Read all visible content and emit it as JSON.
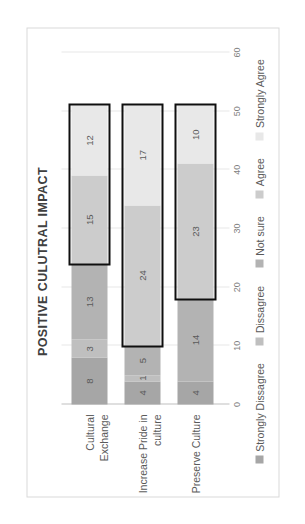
{
  "chart_data": {
    "type": "bar",
    "orientation": "horizontal-stacked",
    "title": "POSITIVE CULUTRAL IMPACT",
    "xlabel": "",
    "ylabel": "",
    "xlim": [
      0,
      60
    ],
    "xticks": [
      0,
      10,
      20,
      30,
      40,
      50,
      60
    ],
    "grid": true,
    "legend_position": "bottom",
    "categories": [
      "Cultural Exchange",
      "Increase Pride in culture",
      "Preserve Culture"
    ],
    "series": [
      {
        "name": "Strongly Dissagree",
        "color": "#a6a6a6",
        "values": [
          8,
          4,
          4
        ]
      },
      {
        "name": "Dissagree",
        "color": "#bfbfbf",
        "values": [
          3,
          1,
          0
        ]
      },
      {
        "name": "Not sure",
        "color": "#b3b3b3",
        "values": [
          13,
          5,
          14
        ]
      },
      {
        "name": "Agree",
        "color": "#cccccc",
        "values": [
          15,
          24,
          23
        ]
      },
      {
        "name": "Strongly Agree",
        "color": "#e8e8e8",
        "values": [
          12,
          17,
          10
        ]
      }
    ],
    "annotations": [
      {
        "name": "highlight-cultural-exchange",
        "category": "Cultural Exchange",
        "from": 24,
        "to": 51
      },
      {
        "name": "highlight-increase-pride",
        "category": "Increase Pride in culture",
        "from": 10,
        "to": 51
      },
      {
        "name": "highlight-preserve-culture",
        "category": "Preserve Culture",
        "from": 18,
        "to": 51
      }
    ],
    "data_labels": {
      "Cultural Exchange": [
        "8",
        "3",
        "13",
        "15",
        "12"
      ],
      "Increase Pride in culture": [
        "4",
        "1",
        "5",
        "24",
        "17"
      ],
      "Preserve Culture": [
        "4",
        "0",
        "14",
        "23",
        "10"
      ]
    }
  },
  "legend": {
    "items": [
      {
        "label": "Strongly Dissagree",
        "color": "#a6a6a6"
      },
      {
        "label": "Dissagree",
        "color": "#bfbfbf"
      },
      {
        "label": "Not sure",
        "color": "#b3b3b3"
      },
      {
        "label": "Agree",
        "color": "#cccccc"
      },
      {
        "label": "Strongly Agree",
        "color": "#e8e8e8"
      }
    ]
  },
  "axis": {
    "ticks": [
      "0",
      "10",
      "20",
      "30",
      "40",
      "50",
      "60"
    ]
  }
}
